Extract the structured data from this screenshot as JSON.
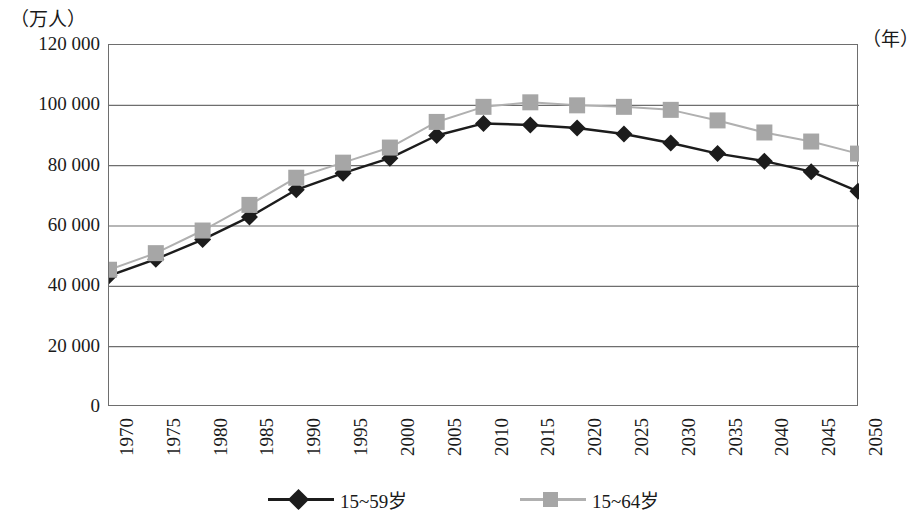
{
  "chart_data": {
    "type": "line",
    "title": "",
    "subtitle": "",
    "xlabel": "（年）",
    "ylabel": "（万人）",
    "x": [
      "1970",
      "1975",
      "1980",
      "1985",
      "1990",
      "1995",
      "2000",
      "2005",
      "2010",
      "2015",
      "2020",
      "2025",
      "2030",
      "2035",
      "2040",
      "2045",
      "2050"
    ],
    "categories": [
      "1970",
      "1975",
      "1980",
      "1985",
      "1990",
      "1995",
      "2000",
      "2005",
      "2010",
      "2015",
      "2020",
      "2025",
      "2030",
      "2035",
      "2040",
      "2045",
      "2050"
    ],
    "series": [
      {
        "name": "15~59岁",
        "color": "#1c1c1c",
        "marker": "diamond",
        "values": [
          43500,
          49000,
          55500,
          63000,
          72000,
          77500,
          82500,
          90000,
          94000,
          93500,
          92500,
          90500,
          87500,
          84000,
          81500,
          78000,
          71500
        ]
      },
      {
        "name": "15~64岁",
        "color": "#a6a6a6",
        "marker": "square",
        "values": [
          45500,
          51000,
          58500,
          67000,
          76000,
          81000,
          86000,
          94500,
          99500,
          101000,
          100000,
          99500,
          98500,
          95000,
          91000,
          88000,
          84000
        ]
      }
    ],
    "ylim": [
      0,
      120000
    ],
    "ytick_values": [
      0,
      20000,
      40000,
      60000,
      80000,
      100000,
      120000
    ],
    "ytick_labels": [
      "0",
      "20 000",
      "40 000",
      "60 000",
      "80 000",
      "100 000",
      "120 000"
    ],
    "grid": "horizontal",
    "legend_position": "bottom"
  },
  "legend": {
    "items": [
      {
        "label": "15~59岁",
        "color": "#1c1c1c",
        "line_color": "#1c1c1c",
        "marker": "diamond"
      },
      {
        "label": "15~64岁",
        "color": "#a6a6a6",
        "line_color": "#b0b0b0",
        "marker": "square"
      }
    ]
  },
  "axes": {
    "y_unit_label": "（万人）",
    "x_unit_label": "（年）"
  },
  "colors": {
    "series_dark": "#1c1c1c",
    "series_gray": "#a6a6a6",
    "series_gray_line": "#b0b0b0",
    "gridline": "#6e6e6e",
    "frame": "#6e6e6e",
    "background": "#ffffff"
  }
}
